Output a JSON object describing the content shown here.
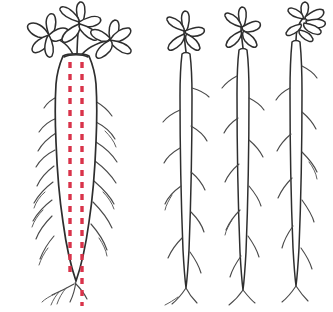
{
  "figure": {
    "background_color": "#ffffff",
    "width": 333,
    "height": 312,
    "outline_color": "#2e2e2e",
    "rootlet_color": "#4a4a4a",
    "measurement_color": "#d9334a",
    "caption": "",
    "axis_labels": [],
    "annotations": []
  },
  "specimens": [
    {
      "id": "taproot-specimen",
      "name": "thickened-storage-taproot",
      "label": "",
      "position": "left",
      "stem_center_x": 76,
      "crown_y": 55,
      "root_tip_y": 282,
      "max_root_width": 42,
      "root_shape": "thickened tapering taproot",
      "leaf_cluster_count": 3,
      "leaflets_per_cluster": 5,
      "lateral_root_count": 18,
      "has_measurement_marks": true
    },
    {
      "id": "seedling-specimen-1",
      "name": "slender-seedling-root-1",
      "label": "",
      "position": "center-left",
      "stem_center_x": 186,
      "crown_y": 50,
      "root_tip_y": 288,
      "max_root_width": 7,
      "root_shape": "slender non-thickened root",
      "leaf_cluster_count": 1,
      "leaflets_per_cluster": 5,
      "lateral_root_count": 11,
      "has_measurement_marks": false
    },
    {
      "id": "seedling-specimen-2",
      "name": "slender-seedling-root-2",
      "label": "",
      "position": "center-right",
      "stem_center_x": 243,
      "crown_y": 46,
      "root_tip_y": 290,
      "max_root_width": 7,
      "root_shape": "slender non-thickened root",
      "leaf_cluster_count": 1,
      "leaflets_per_cluster": 5,
      "lateral_root_count": 10,
      "has_measurement_marks": false
    },
    {
      "id": "seedling-specimen-3",
      "name": "slender-seedling-root-3",
      "label": "",
      "position": "right",
      "stem_center_x": 296,
      "crown_y": 36,
      "root_tip_y": 286,
      "max_root_width": 7,
      "root_shape": "slender non-thickened root",
      "leaf_cluster_count": 1,
      "leaflets_per_cluster": 7,
      "lateral_root_count": 10,
      "has_measurement_marks": false
    }
  ],
  "measurement": {
    "name": "root-width-measurement-marks",
    "color": "#d9334a",
    "style": "vertical dashed lines",
    "line_count": 2,
    "left_line_x": 70,
    "right_line_x": 82,
    "top_y": 62,
    "bottom_y": 306,
    "dash_length": 6,
    "dash_gap": 6
  }
}
